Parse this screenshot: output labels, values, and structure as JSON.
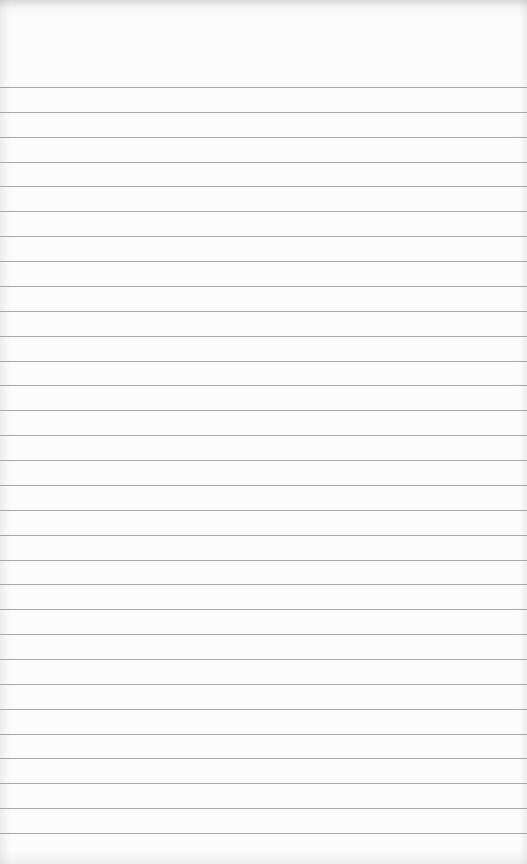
{
  "paper": {
    "type": "lined-notepaper",
    "line_color": "#8e8e8e",
    "background_color": "#fcfcfc",
    "first_line_y": 87,
    "line_spacing": 24.87,
    "line_count": 31
  }
}
